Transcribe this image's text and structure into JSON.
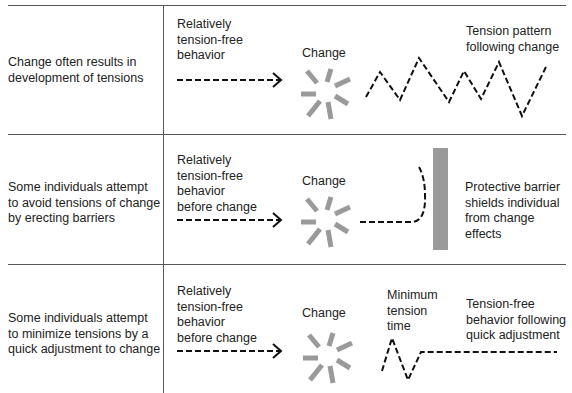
{
  "rows": [
    {
      "description": "Change often results in\ndevelopment of tensions",
      "before_label": "Relatively\ntension-free\nbehavior",
      "change_label": "Change",
      "after_label": "Tension pattern\nfollowing change"
    },
    {
      "description": "Some individuals attempt\nto avoid tensions of change\nby erecting barriers",
      "before_label": "Relatively\ntension-free\nbehavior\nbefore change",
      "change_label": "Change",
      "after_label": "Protective barrier\nshields individual\nfrom change effects"
    },
    {
      "description": "Some individuals attempt\nto minimize tensions by a\nquick adjustment to change",
      "before_label": "Relatively\ntension-free\nbehavior\nbefore change",
      "change_label": "Change",
      "middle_label": "Minimum\ntension\ntime",
      "after_label": "Tension-free\nbehavior following\nquick adjustment"
    }
  ],
  "colors": {
    "line": "#555555",
    "starburst": "#9a9a9a",
    "barrier": "#9a9a9a",
    "dash": "#111111"
  }
}
